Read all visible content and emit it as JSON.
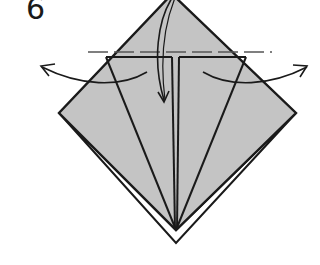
{
  "diagram": {
    "step_number": "6",
    "colors": {
      "paper_fill": "#c4c4c4",
      "line": "#1a1a1a",
      "background": "#ffffff"
    },
    "elements": {
      "model": "diamond-shaped folded paper with kite folds",
      "valley_fold_line": "dashed horizontal line across top",
      "arrows": [
        "fold-down-arrow",
        "unfold-left-arrow",
        "unfold-right-arrow"
      ]
    }
  }
}
